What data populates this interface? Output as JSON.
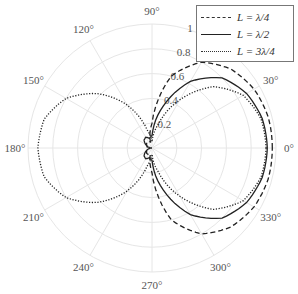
{
  "chart_data": {
    "type": "polar",
    "title": "",
    "angle_ticks": [
      "0°",
      "30°",
      "60°",
      "90°",
      "120°",
      "150°",
      "180°",
      "210°",
      "240°",
      "270°",
      "300°",
      "330°"
    ],
    "angle_tick_values": [
      0,
      30,
      60,
      90,
      120,
      150,
      180,
      210,
      240,
      270,
      300,
      330
    ],
    "radial_ticks": [
      "0.2",
      "0.4",
      "0.6",
      "0.8",
      "1"
    ],
    "radial_tick_values": [
      0.2,
      0.4,
      0.6,
      0.8,
      1
    ],
    "rlim": [
      0,
      1
    ],
    "grid": true,
    "legend_position": "upper right",
    "angles": [
      0,
      15,
      30,
      45,
      60,
      75,
      90,
      105,
      120,
      135,
      150,
      165,
      180,
      195,
      210,
      225,
      240,
      255,
      270,
      285,
      300,
      315,
      330,
      345,
      360
    ],
    "series": [
      {
        "name": "L = λ/4",
        "style": "dashed",
        "values": [
          0.97,
          0.97,
          0.95,
          0.9,
          0.8,
          0.6,
          0.2,
          0.05,
          0.06,
          0.06,
          0.05,
          0.04,
          0.04,
          0.04,
          0.05,
          0.06,
          0.06,
          0.05,
          0.2,
          0.6,
          0.8,
          0.9,
          0.95,
          0.97,
          0.97
        ]
      },
      {
        "name": "L = λ/2",
        "style": "solid",
        "values": [
          0.93,
          0.92,
          0.88,
          0.8,
          0.62,
          0.35,
          0.1,
          0.08,
          0.1,
          0.09,
          0.06,
          0.03,
          0.0,
          0.03,
          0.06,
          0.09,
          0.1,
          0.08,
          0.1,
          0.35,
          0.62,
          0.8,
          0.88,
          0.92,
          0.93
        ]
      },
      {
        "name": "L = 3λ/4",
        "style": "dotted",
        "values": [
          0.92,
          0.91,
          0.85,
          0.7,
          0.45,
          0.2,
          0.05,
          0.15,
          0.4,
          0.62,
          0.8,
          0.9,
          0.92,
          0.9,
          0.8,
          0.62,
          0.4,
          0.15,
          0.05,
          0.2,
          0.45,
          0.7,
          0.85,
          0.91,
          0.92
        ]
      }
    ]
  },
  "legend": {
    "items": [
      "L = λ/4",
      "L = λ/2",
      "L = 3λ/4"
    ]
  }
}
